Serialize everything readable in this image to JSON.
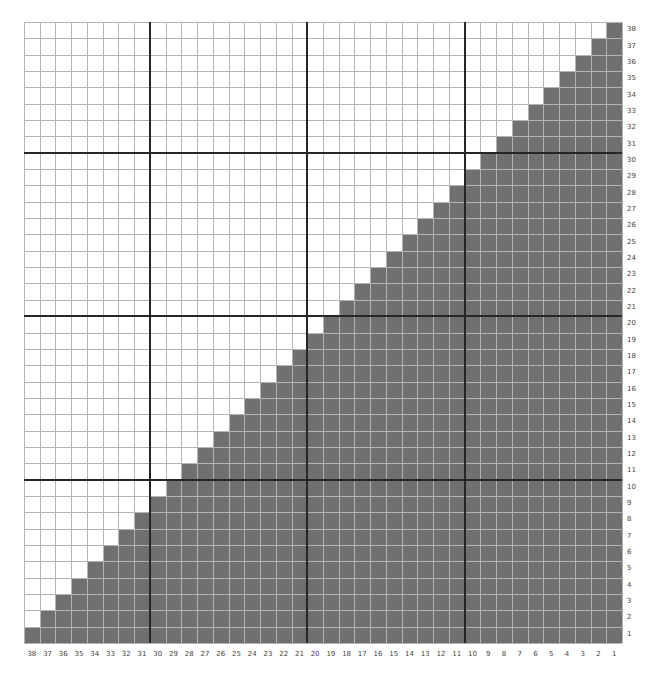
{
  "chart_data": {
    "type": "heatmap",
    "title": "",
    "columns": 38,
    "rows": 38,
    "x_tick_labels": [
      "38",
      "37",
      "36",
      "35",
      "34",
      "33",
      "32",
      "31",
      "30",
      "29",
      "28",
      "27",
      "26",
      "25",
      "24",
      "23",
      "22",
      "21",
      "20",
      "19",
      "18",
      "17",
      "16",
      "15",
      "14",
      "13",
      "12",
      "11",
      "10",
      "9",
      "8",
      "7",
      "6",
      "5",
      "4",
      "3",
      "2",
      "1"
    ],
    "y_tick_labels_bottom_to_top": [
      "1",
      "2",
      "3",
      "4",
      "5",
      "6",
      "7",
      "8",
      "9",
      "10",
      "11",
      "12",
      "13",
      "14",
      "15",
      "16",
      "17",
      "18",
      "19",
      "20",
      "21",
      "22",
      "23",
      "24",
      "25",
      "26",
      "27",
      "28",
      "29",
      "30",
      "31",
      "32",
      "33",
      "34",
      "35",
      "36",
      "37",
      "38"
    ],
    "filled_cells_per_row_bottom_to_top": [
      38,
      37,
      36,
      35,
      34,
      33,
      32,
      31,
      30,
      29,
      28,
      27,
      26,
      25,
      24,
      23,
      22,
      21,
      20,
      19,
      18,
      17,
      16,
      15,
      14,
      13,
      12,
      11,
      10,
      9,
      8,
      7,
      6,
      5,
      4,
      3,
      2,
      1
    ],
    "major_gridline_every_from_right": 10,
    "major_gridline_every_from_bottom": 10,
    "x_axis_position": "bottom",
    "y_axis_position": "right",
    "grid": true,
    "legend": null
  },
  "colors": {
    "filled": "#707070",
    "empty": "#ffffff",
    "thin_line": "#b4b4b4",
    "thin_line_on_fill": "#9c9c9c",
    "thick_line": "#262626",
    "label": "#444444"
  }
}
